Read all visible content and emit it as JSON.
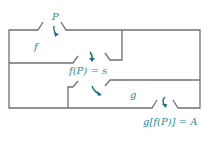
{
  "diagram": {
    "type": "composition-of-functions-machines",
    "colors": {
      "line": "#707070",
      "label": "#2a8a9a",
      "arrow": "#1f6f85"
    },
    "labels": {
      "input": "P",
      "machine_f": "f",
      "intermediate": "f(P) = s",
      "machine_g": "g",
      "output": "g[f(P)] = A"
    }
  }
}
